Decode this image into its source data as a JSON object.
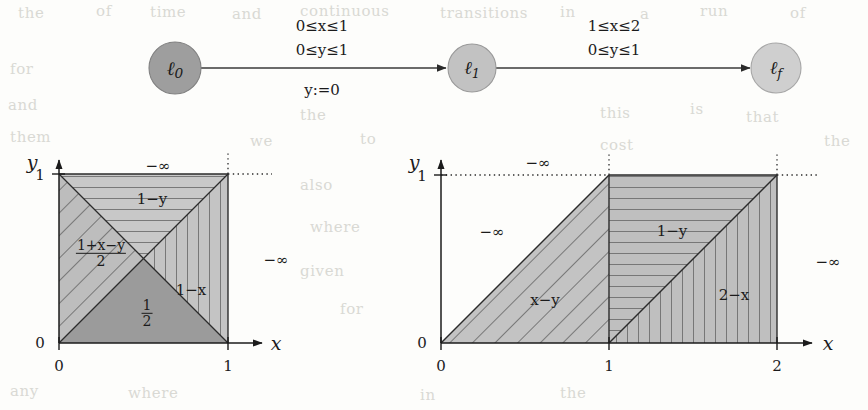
{
  "figure": {
    "kind": "timed-automaton-with-cost-regions",
    "background_note": "scanned page with faint bleed-through text"
  },
  "automaton": {
    "nodes": [
      {
        "id": "l0",
        "label": "ℓ",
        "sub": "0",
        "cx": 175,
        "cy": 68,
        "r": 26,
        "fill": "#9e9e9e"
      },
      {
        "id": "l1",
        "label": "ℓ",
        "sub": "1",
        "cx": 472,
        "cy": 68,
        "r": 24,
        "fill": "#c2c2c2"
      },
      {
        "id": "lf",
        "label": "ℓ",
        "sub": "f",
        "cx": 776,
        "cy": 68,
        "r": 25,
        "fill": "#cfcfcf"
      }
    ],
    "edges": [
      {
        "id": "e0",
        "from": "l0",
        "to": "l1",
        "guard_x": "0≤x≤1",
        "guard_y": "0≤y≤1",
        "assignment": "y:=0"
      },
      {
        "id": "e1",
        "from": "l1",
        "to": "lf",
        "guard_x": "1≤x≤2",
        "guard_y": "0≤y≤1",
        "assignment": ""
      }
    ]
  },
  "plots": [
    {
      "id": "left-plot",
      "axis": {
        "xlabel": "x",
        "ylabel": "y",
        "xticks": [
          "0",
          "1"
        ],
        "yticks": [
          "0",
          "1"
        ],
        "xlim": [
          0,
          1
        ],
        "ylim": [
          0,
          1
        ],
        "origin_px": {
          "x": 59,
          "y": 343
        },
        "unit_px": 169
      },
      "regions": [
        {
          "name": "top-wedge",
          "label": "1−y",
          "hatch": "horizontal",
          "fill": "#c8c8c8"
        },
        {
          "name": "left-wedge",
          "label": "(1+x−y)/2",
          "label_kind": "fraction",
          "num": "1+x−y",
          "den": "2",
          "hatch": "diagonal-45",
          "fill": "#bdbdbd"
        },
        {
          "name": "bottom-wedge",
          "label": "1/2",
          "label_kind": "fraction",
          "num": "1",
          "den": "2",
          "hatch": "none",
          "fill": "#9b9b9b"
        },
        {
          "name": "right-wedge",
          "label": "1−x",
          "hatch": "vertical",
          "fill": "#c4c4c4"
        }
      ],
      "outside_labels": [
        {
          "name": "above",
          "text": "−∞",
          "x": 158,
          "y": 166
        },
        {
          "name": "right",
          "text": "−∞",
          "x": 275,
          "y": 260
        }
      ]
    },
    {
      "id": "right-plot",
      "axis": {
        "xlabel": "x",
        "ylabel": "y",
        "xticks": [
          "0",
          "1",
          "2"
        ],
        "yticks": [
          "0",
          "1"
        ],
        "xlim": [
          0,
          2
        ],
        "ylim": [
          0,
          1
        ],
        "origin_px": {
          "x": 441,
          "y": 343
        },
        "unit_px": 168
      },
      "regions": [
        {
          "name": "left-parallelogram",
          "label": "x−y",
          "hatch": "diagonal-45",
          "fill": "#c3c3c3"
        },
        {
          "name": "upper-right-wedge",
          "label": "1−y",
          "hatch": "horizontal",
          "fill": "#bfbfbf"
        },
        {
          "name": "lower-right-wedge",
          "label": "2−x",
          "hatch": "vertical",
          "fill": "#c6c6c6"
        }
      ],
      "outside_labels": [
        {
          "name": "above",
          "text": "−∞",
          "x": 538,
          "y": 163
        },
        {
          "name": "upper-left",
          "text": "−∞",
          "x": 492,
          "y": 230
        },
        {
          "name": "right",
          "text": "−∞",
          "x": 826,
          "y": 262
        }
      ]
    }
  ],
  "ghost_text": [
    {
      "t": "the",
      "x": 18,
      "y": 4
    },
    {
      "t": "of",
      "x": 96,
      "y": 2
    },
    {
      "t": "time",
      "x": 150,
      "y": 3
    },
    {
      "t": "and",
      "x": 232,
      "y": 5
    },
    {
      "t": "continuous",
      "x": 300,
      "y": 2
    },
    {
      "t": "transitions",
      "x": 440,
      "y": 4
    },
    {
      "t": "in",
      "x": 560,
      "y": 3
    },
    {
      "t": "a",
      "x": 640,
      "y": 5
    },
    {
      "t": "run",
      "x": 700,
      "y": 2
    },
    {
      "t": "of",
      "x": 790,
      "y": 4
    },
    {
      "t": "for",
      "x": 10,
      "y": 60
    },
    {
      "t": "and",
      "x": 8,
      "y": 96
    },
    {
      "t": "them",
      "x": 10,
      "y": 128
    },
    {
      "t": "the",
      "x": 300,
      "y": 106
    },
    {
      "t": "we",
      "x": 250,
      "y": 132
    },
    {
      "t": "to",
      "x": 360,
      "y": 130
    },
    {
      "t": "this",
      "x": 600,
      "y": 104
    },
    {
      "t": "is",
      "x": 690,
      "y": 100
    },
    {
      "t": "that",
      "x": 746,
      "y": 108
    },
    {
      "t": "cost",
      "x": 600,
      "y": 136
    },
    {
      "t": "the",
      "x": 824,
      "y": 132
    },
    {
      "t": "also",
      "x": 300,
      "y": 176
    },
    {
      "t": "where",
      "x": 310,
      "y": 218
    },
    {
      "t": "and",
      "x": 640,
      "y": 196
    },
    {
      "t": "given",
      "x": 300,
      "y": 262
    },
    {
      "t": "for",
      "x": 340,
      "y": 300
    },
    {
      "t": "any",
      "x": 10,
      "y": 382
    },
    {
      "t": "where",
      "x": 128,
      "y": 384
    },
    {
      "t": "in",
      "x": 420,
      "y": 386
    },
    {
      "t": "the",
      "x": 560,
      "y": 384
    }
  ]
}
